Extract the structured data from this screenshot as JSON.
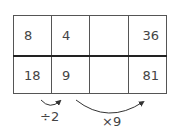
{
  "table": {
    "rows": [
      [
        "8",
        "4",
        "",
        "36"
      ],
      [
        "18",
        "9",
        "",
        "81"
      ]
    ]
  },
  "operations": [
    {
      "label": "÷2",
      "from_column": 1,
      "to_column": 2
    },
    {
      "label": "×9",
      "from_column": 2,
      "to_column": 4
    }
  ],
  "colors": {
    "border": "#555555",
    "divider": "#222222",
    "text": "#444444"
  }
}
